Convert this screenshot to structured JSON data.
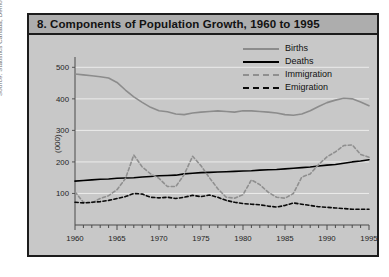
{
  "figure": {
    "title": "8. Components of Population Growth, 1960 to 1995",
    "source": "Source: Statistics Canada, Demography Division"
  },
  "legend": {
    "position": "top-right",
    "entries": [
      {
        "label": "Births",
        "color": "#8c8c8c",
        "style": "solid",
        "icon": "line-swatch-icon"
      },
      {
        "label": "Deaths",
        "color": "#000000",
        "style": "solid",
        "icon": "line-swatch-icon"
      },
      {
        "label": "Immigration",
        "color": "#8f8f8f",
        "style": "dashed",
        "icon": "dashed-line-swatch-icon"
      },
      {
        "label": "Emigration",
        "color": "#0a0a0a",
        "style": "dashed",
        "icon": "dashed-line-swatch-icon"
      }
    ]
  },
  "chart_data": {
    "type": "line",
    "title": "8. Components of Population Growth, 1960 to 1995",
    "xlabel": "",
    "ylabel": "(000)",
    "xlim": [
      1960,
      1995
    ],
    "ylim": [
      0,
      520
    ],
    "grid": true,
    "y_ticks": [
      100,
      200,
      300,
      400,
      500
    ],
    "x_ticks": [
      1960,
      1965,
      1970,
      1975,
      1980,
      1985,
      1990,
      1995
    ],
    "x_minor_tick_interval": 1,
    "x": [
      1960,
      1961,
      1962,
      1963,
      1964,
      1965,
      1966,
      1967,
      1968,
      1969,
      1970,
      1971,
      1972,
      1973,
      1974,
      1975,
      1976,
      1977,
      1978,
      1979,
      1980,
      1981,
      1982,
      1983,
      1984,
      1985,
      1986,
      1987,
      1988,
      1989,
      1990,
      1991,
      1992,
      1993,
      1994,
      1995
    ],
    "series": [
      {
        "name": "Births",
        "color": "#8c8c8c",
        "style": "solid",
        "values": [
          479,
          476,
          473,
          470,
          466,
          452,
          428,
          406,
          389,
          373,
          362,
          359,
          352,
          350,
          355,
          358,
          360,
          362,
          360,
          358,
          362,
          362,
          360,
          358,
          355,
          350,
          348,
          352,
          362,
          376,
          388,
          396,
          402,
          400,
          390,
          378
        ]
      },
      {
        "name": "Deaths",
        "color": "#000000",
        "style": "solid",
        "values": [
          139,
          141,
          143,
          145,
          146,
          148,
          149,
          150,
          152,
          154,
          156,
          157,
          158,
          162,
          164,
          166,
          167,
          168,
          169,
          170,
          171,
          172,
          174,
          175,
          176,
          178,
          180,
          182,
          184,
          187,
          190,
          192,
          196,
          200,
          203,
          207
        ]
      },
      {
        "name": "Immigration",
        "color": "#8f8f8f",
        "style": "dashed",
        "values": [
          105,
          72,
          70,
          84,
          93,
          112,
          147,
          222,
          184,
          162,
          148,
          122,
          122,
          160,
          218,
          188,
          150,
          115,
          88,
          85,
          96,
          143,
          128,
          104,
          88,
          85,
          100,
          152,
          162,
          192,
          216,
          232,
          252,
          254,
          224,
          215
        ]
      },
      {
        "name": "Emigration",
        "color": "#0a0a0a",
        "style": "dashed",
        "values": [
          72,
          70,
          72,
          74,
          78,
          84,
          90,
          100,
          98,
          88,
          86,
          88,
          84,
          88,
          94,
          90,
          95,
          88,
          78,
          72,
          68,
          66,
          64,
          60,
          57,
          62,
          70,
          66,
          62,
          58,
          56,
          54,
          52,
          50,
          50,
          50
        ]
      }
    ]
  }
}
